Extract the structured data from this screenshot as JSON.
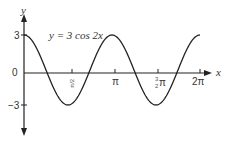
{
  "chart_data": {
    "type": "line",
    "title": "",
    "annotation": "y = 3 cos 2x",
    "xlabel": "x",
    "ylabel": "y",
    "x_ticks": [
      "π/2",
      "π",
      "3/2 π",
      "2π"
    ],
    "y_ticks": [
      "3",
      "0",
      "−3"
    ],
    "xlim": [
      0,
      6.2832
    ],
    "ylim": [
      -3,
      3
    ],
    "grid": false,
    "series": [
      {
        "name": "y = 3 cos 2x",
        "function": "3*cos(2*x)",
        "x": [
          0,
          0.785,
          1.571,
          2.356,
          3.142,
          3.927,
          4.712,
          5.498,
          6.283
        ],
        "values": [
          3,
          0,
          -3,
          0,
          3,
          0,
          -3,
          0,
          3
        ]
      }
    ]
  },
  "labels": {
    "y_axis": "y",
    "x_axis": "x",
    "equation": "y = 3 cos 2x",
    "y3": "3",
    "y0": "0",
    "ym3": "−3",
    "pi_half": "π/2",
    "pi": "π",
    "three_half": "3",
    "three_half_den": "2",
    "three_half_pi": "π",
    "two_pi": "2π"
  }
}
